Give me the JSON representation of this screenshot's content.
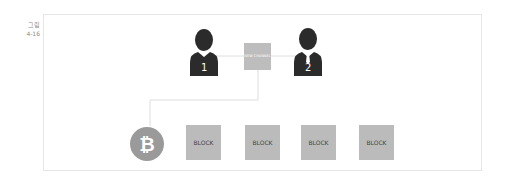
{
  "figure": {
    "label_line1": "그림",
    "label_line2": "4-16"
  },
  "participants": [
    {
      "number": "1",
      "type": "person"
    },
    {
      "number": "2",
      "type": "person-with-tie"
    }
  ],
  "channel": {
    "label": "NEW CHANNEL"
  },
  "chain": {
    "origin_icon": "bitcoin-icon",
    "blocks": [
      "BLOCK",
      "BLOCK",
      "BLOCK",
      "BLOCK"
    ]
  },
  "colors": {
    "person": "#2b2b2b",
    "box": "#bbbbbb",
    "bitcoin": "#9a9a9a",
    "line": "#dedede"
  }
}
